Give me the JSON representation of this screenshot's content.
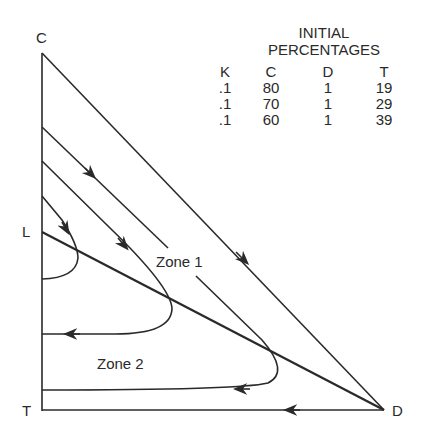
{
  "diagram": {
    "vertices": {
      "top": "C",
      "left_mid": "L",
      "bottom_left": "T",
      "bottom_right": "D"
    },
    "zones": [
      "Zone 1",
      "Zone 2"
    ],
    "legend": {
      "title_line1": "INITIAL",
      "title_line2": "PERCENTAGES",
      "headers": [
        "K",
        "C",
        "D",
        "T"
      ],
      "rows": [
        [
          ".1",
          "80",
          "1",
          "19"
        ],
        [
          ".1",
          "70",
          "1",
          "29"
        ],
        [
          ".1",
          "60",
          "1",
          "39"
        ]
      ]
    }
  },
  "colors": {
    "line": "#2a2a2a",
    "background": "#ffffff"
  }
}
